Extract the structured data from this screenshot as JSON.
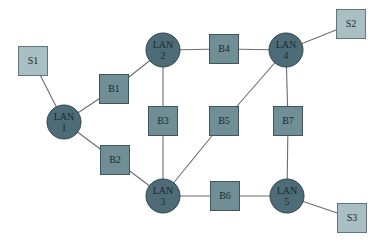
{
  "diagram": {
    "type": "network-topology",
    "colors": {
      "lan_fill": "#4e6c77",
      "bridge_fill": "#6f8e95",
      "server_fill": "#a8bfc3",
      "edge": "#6d6d6d",
      "background": "#ffffff"
    },
    "lans": [
      {
        "id": "LAN1",
        "line1": "LAN",
        "line2": "1",
        "cx": 64,
        "cy": 122,
        "r": 17
      },
      {
        "id": "LAN2",
        "line1": "LAN",
        "line2": "2",
        "cx": 163,
        "cy": 50,
        "r": 17
      },
      {
        "id": "LAN3",
        "line1": "LAN",
        "line2": "3",
        "cx": 163,
        "cy": 196,
        "r": 17
      },
      {
        "id": "LAN4",
        "line1": "LAN",
        "line2": "4",
        "cx": 286,
        "cy": 50,
        "r": 17
      },
      {
        "id": "LAN5",
        "line1": "LAN",
        "line2": "5",
        "cx": 287,
        "cy": 196,
        "r": 17
      }
    ],
    "bridges": [
      {
        "id": "B1",
        "label": "B1",
        "cx": 114,
        "cy": 89
      },
      {
        "id": "B2",
        "label": "B2",
        "cx": 115,
        "cy": 160
      },
      {
        "id": "B3",
        "label": "B3",
        "cx": 163,
        "cy": 121
      },
      {
        "id": "B4",
        "label": "B4",
        "cx": 224,
        "cy": 49
      },
      {
        "id": "B5",
        "label": "B5",
        "cx": 224,
        "cy": 121
      },
      {
        "id": "B6",
        "label": "B6",
        "cx": 225,
        "cy": 196
      },
      {
        "id": "B7",
        "label": "B7",
        "cx": 288,
        "cy": 121
      }
    ],
    "servers": [
      {
        "id": "S1",
        "label": "S1",
        "cx": 33,
        "cy": 61
      },
      {
        "id": "S2",
        "label": "S2",
        "cx": 351,
        "cy": 24
      },
      {
        "id": "S3",
        "label": "S3",
        "cx": 352,
        "cy": 218
      }
    ],
    "box_size": 29,
    "edges": [
      [
        "S1",
        "LAN1"
      ],
      [
        "LAN1",
        "B1"
      ],
      [
        "B1",
        "LAN2"
      ],
      [
        "LAN1",
        "B2"
      ],
      [
        "B2",
        "LAN3"
      ],
      [
        "LAN2",
        "B3"
      ],
      [
        "B3",
        "LAN3"
      ],
      [
        "LAN2",
        "B4"
      ],
      [
        "B4",
        "LAN4"
      ],
      [
        "LAN4",
        "S2"
      ],
      [
        "LAN4",
        "B5"
      ],
      [
        "B5",
        "LAN3"
      ],
      [
        "LAN4",
        "B7"
      ],
      [
        "B7",
        "LAN5"
      ],
      [
        "LAN3",
        "B6"
      ],
      [
        "B6",
        "LAN5"
      ],
      [
        "LAN5",
        "S3"
      ]
    ]
  }
}
